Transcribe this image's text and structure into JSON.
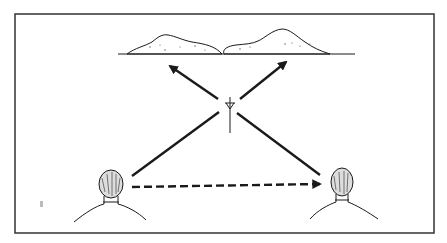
{
  "diagram": {
    "type": "illustration",
    "frame": {
      "x": 15,
      "y": 14,
      "w": 419,
      "h": 219,
      "stroke": "#333333"
    },
    "ground_line": {
      "x1": 118,
      "x2": 355,
      "y": 54
    },
    "mountains": [
      {
        "name": "left-hill",
        "peak": [
          163,
          35
        ]
      },
      {
        "name": "right-hill",
        "peak": [
          285,
          30
        ]
      }
    ],
    "tower": {
      "x": 230,
      "y_top": 97,
      "y_bottom": 133
    },
    "people": [
      {
        "name": "left-listener",
        "x": 112,
        "y": 186
      },
      {
        "name": "right-listener",
        "x": 348,
        "y": 186
      }
    ],
    "arrows": [
      {
        "name": "tower-to-left-hill",
        "from": [
          218,
          99
        ],
        "to": [
          168,
          65
        ],
        "style": "solid",
        "head": true
      },
      {
        "name": "tower-to-right-hill",
        "from": [
          240,
          99
        ],
        "to": [
          288,
          60
        ],
        "style": "solid",
        "head": true
      },
      {
        "name": "left-person-to-tower",
        "from": [
          132,
          176
        ],
        "to": [
          219,
          112
        ],
        "style": "solid",
        "head": false
      },
      {
        "name": "tower-to-right-person",
        "from": [
          237,
          113
        ],
        "to": [
          320,
          175
        ],
        "style": "solid",
        "head": false
      },
      {
        "name": "direct-path",
        "from": [
          132,
          187
        ],
        "to": [
          322,
          184
        ],
        "style": "dashed",
        "head": true
      }
    ],
    "colors": {
      "ink": "#1a1a1a",
      "background": "#ffffff"
    }
  }
}
